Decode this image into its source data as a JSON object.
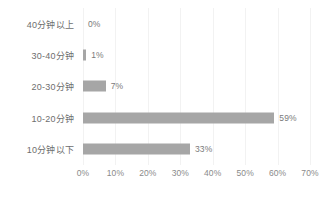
{
  "chart_data": {
    "type": "bar",
    "orientation": "horizontal",
    "title": "",
    "subtitle": "",
    "xlabel": "",
    "ylabel": "",
    "categories": [
      "40分钟以上",
      "30-40分钟",
      "20-30分钟",
      "10-20分钟",
      "10分钟以下"
    ],
    "values": [
      0,
      1,
      7,
      59,
      33
    ],
    "data_labels": [
      "0%",
      "1%",
      "7%",
      "59%",
      "33%"
    ],
    "xlim": [
      0,
      70
    ],
    "xticks": [
      0,
      10,
      20,
      30,
      40,
      50,
      60,
      70
    ],
    "xtick_labels": [
      "0%",
      "10%",
      "20%",
      "30%",
      "40%",
      "50%",
      "60%",
      "70%"
    ],
    "grid": true,
    "grid_axis": "x",
    "legend": false,
    "legend_position": "none",
    "series": [
      {
        "name": "",
        "values": [
          0,
          1,
          7,
          59,
          33
        ]
      }
    ],
    "colors": {
      "bar": "#a6a6a6",
      "gridline": "#f2f2f2",
      "axis": "#e8e8e8",
      "category_text": "#6e6e6e",
      "value_text": "#7a7a7a",
      "tick_text": "#8a8a8a",
      "background": "#ffffff"
    }
  }
}
